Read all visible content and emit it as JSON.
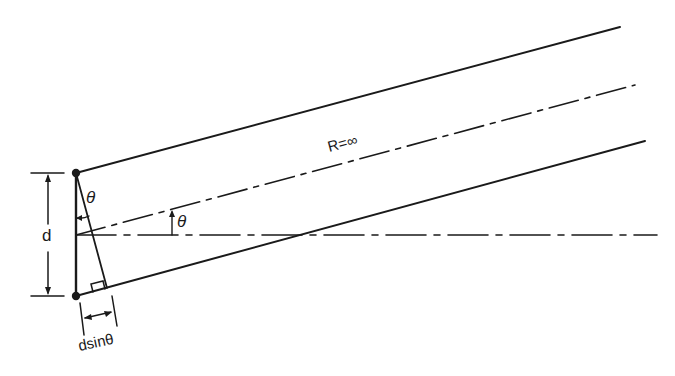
{
  "diagram": {
    "title": "",
    "labels": {
      "range": "R=∞",
      "theta_top": "θ",
      "theta_axis": "θ",
      "spacing": "d",
      "path_difference": "dsinθ"
    },
    "elements": {
      "points": [
        "top-source",
        "bottom-source"
      ],
      "lines": [
        "top-ray",
        "center-ray-dashdot",
        "bottom-ray",
        "horizontal-axis-dashdot",
        "perpendicular-foot"
      ],
      "dimension_markers": [
        "spacing-d-arrow",
        "path-difference-arrow"
      ],
      "right_angle_marker": true
    },
    "colors": {
      "ink": "#1a1a1a",
      "background": "#ffffff"
    }
  }
}
